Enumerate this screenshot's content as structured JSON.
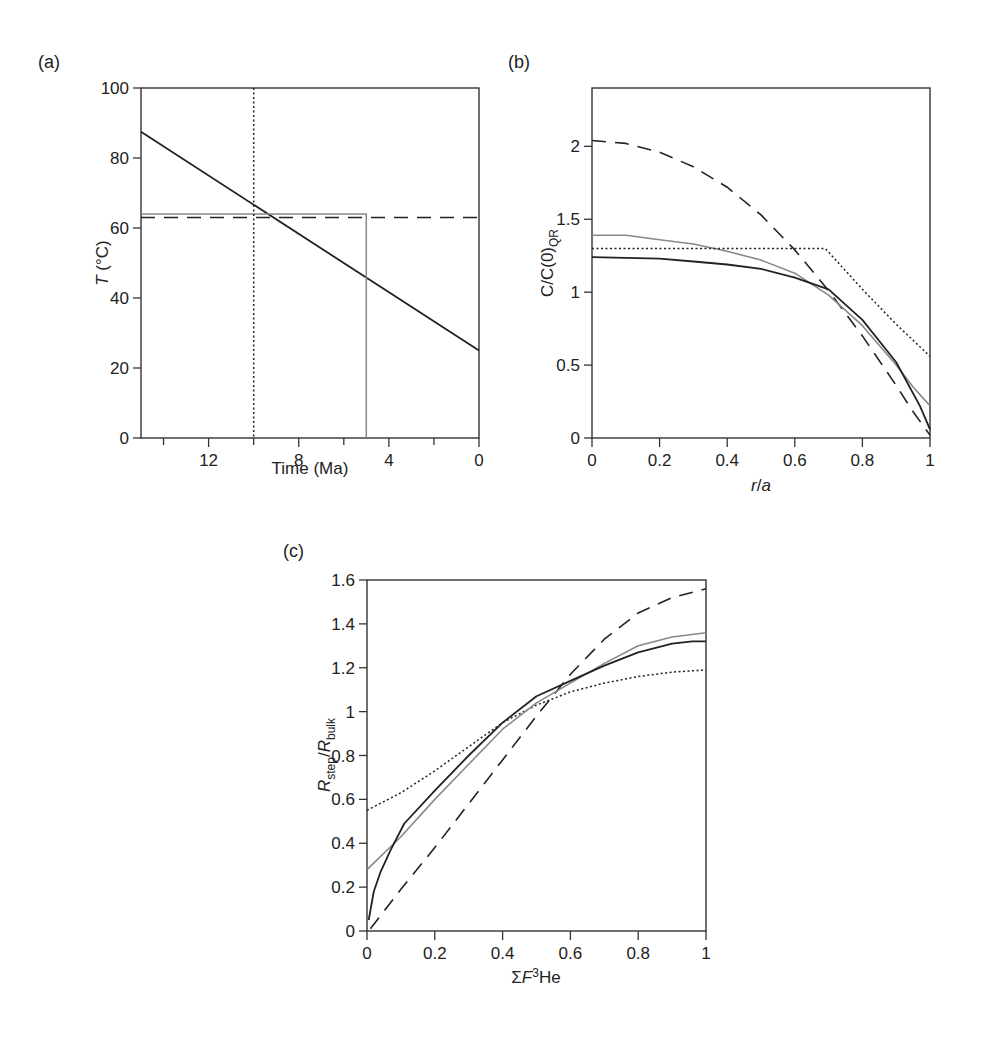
{
  "figure": {
    "panels": [
      "(a)",
      "(b)",
      "(c)"
    ]
  },
  "chart_data": [
    {
      "id": "a",
      "panel_label": "(a)",
      "type": "line",
      "title": "",
      "xlabel": "Time (Ma)",
      "ylabel": "T (°C)",
      "xlim": [
        15,
        0
      ],
      "ylim": [
        0,
        100
      ],
      "x_inverted": true,
      "xticks": [
        12,
        8,
        4,
        0
      ],
      "xminor_ticks": [
        14,
        10,
        6,
        2
      ],
      "yticks": [
        0,
        20,
        40,
        60,
        80,
        100
      ],
      "grid": false,
      "series": [
        {
          "name": "linear cooling path",
          "style": "solid",
          "color": "#222222",
          "width": 1.8,
          "x": [
            15,
            0
          ],
          "y": [
            87.5,
            25
          ]
        },
        {
          "name": "isothermal holding (gray)",
          "style": "solid",
          "color": "#888888",
          "width": 1.5,
          "x": [
            15,
            5,
            5
          ],
          "y": [
            64,
            64,
            0
          ]
        },
        {
          "name": "constant temperature (dashed)",
          "style": "dashed",
          "color": "#222222",
          "width": 1.5,
          "x": [
            15,
            0
          ],
          "y": [
            63,
            63
          ]
        },
        {
          "name": "instantaneous cooling at 10 Ma (dotted)",
          "style": "dotted",
          "color": "#222222",
          "width": 1.5,
          "x": [
            10,
            10
          ],
          "y": [
            100,
            0
          ]
        }
      ]
    },
    {
      "id": "b",
      "panel_label": "(b)",
      "type": "line",
      "title": "",
      "xlabel": "r/a",
      "ylabel": "C/C(0)QR",
      "xlim": [
        0,
        1.0
      ],
      "ylim": [
        0,
        2.4
      ],
      "xticks": [
        0,
        0.2,
        0.4,
        0.6,
        0.8,
        1.0
      ],
      "yticks": [
        0,
        0.5,
        1.0,
        1.5,
        2.0
      ],
      "grid": false,
      "series": [
        {
          "name": "dashed",
          "style": "dashed",
          "color": "#222222",
          "width": 1.6,
          "x": [
            0,
            0.1,
            0.2,
            0.3,
            0.4,
            0.5,
            0.6,
            0.7,
            0.8,
            0.9,
            0.95,
            1.0
          ],
          "y": [
            2.04,
            2.02,
            1.96,
            1.86,
            1.72,
            1.53,
            1.29,
            1.01,
            0.7,
            0.36,
            0.18,
            0.02
          ]
        },
        {
          "name": "gray",
          "style": "solid",
          "color": "#888888",
          "width": 1.6,
          "x": [
            0,
            0.1,
            0.2,
            0.3,
            0.4,
            0.5,
            0.6,
            0.7,
            0.8,
            0.9,
            0.95,
            1.0
          ],
          "y": [
            1.39,
            1.39,
            1.36,
            1.33,
            1.28,
            1.22,
            1.13,
            0.98,
            0.77,
            0.5,
            0.35,
            0.22
          ]
        },
        {
          "name": "dotted",
          "style": "dotted",
          "color": "#222222",
          "width": 1.5,
          "x": [
            0,
            0.69,
            0.8,
            0.9,
            1.0
          ],
          "y": [
            1.3,
            1.3,
            1.02,
            0.78,
            0.56
          ]
        },
        {
          "name": "solid black",
          "style": "solid",
          "color": "#222222",
          "width": 1.8,
          "x": [
            0,
            0.1,
            0.2,
            0.3,
            0.4,
            0.5,
            0.6,
            0.7,
            0.8,
            0.9,
            0.97,
            1.0
          ],
          "y": [
            1.24,
            1.235,
            1.23,
            1.21,
            1.19,
            1.16,
            1.1,
            1.02,
            0.81,
            0.52,
            0.22,
            0.06
          ]
        }
      ]
    },
    {
      "id": "c",
      "panel_label": "(c)",
      "type": "line",
      "title": "",
      "xlabel": "ΣF3He",
      "ylabel": "Rstep/Rbulk",
      "xlim": [
        0,
        1.0
      ],
      "ylim": [
        0,
        1.6
      ],
      "xticks": [
        0,
        0.2,
        0.4,
        0.6,
        0.8,
        1.0
      ],
      "yticks": [
        0,
        0.2,
        0.4,
        0.6,
        0.8,
        1.0,
        1.2,
        1.4,
        1.6
      ],
      "grid": false,
      "series": [
        {
          "name": "dashed",
          "style": "dashed",
          "color": "#222222",
          "width": 1.6,
          "x": [
            0.01,
            0.1,
            0.2,
            0.3,
            0.4,
            0.5,
            0.6,
            0.7,
            0.8,
            0.9,
            1.0
          ],
          "y": [
            0.01,
            0.19,
            0.38,
            0.58,
            0.78,
            0.98,
            1.17,
            1.33,
            1.45,
            1.52,
            1.56
          ]
        },
        {
          "name": "dotted",
          "style": "dotted",
          "color": "#222222",
          "width": 1.5,
          "x": [
            0,
            0.1,
            0.2,
            0.3,
            0.4,
            0.5,
            0.6,
            0.7,
            0.8,
            0.9,
            1.0
          ],
          "y": [
            0.55,
            0.63,
            0.73,
            0.84,
            0.95,
            1.03,
            1.09,
            1.13,
            1.16,
            1.18,
            1.19
          ]
        },
        {
          "name": "gray",
          "style": "solid",
          "color": "#888888",
          "width": 1.6,
          "x": [
            0,
            0.1,
            0.2,
            0.3,
            0.4,
            0.5,
            0.6,
            0.7,
            0.8,
            0.9,
            1.0
          ],
          "y": [
            0.28,
            0.43,
            0.6,
            0.76,
            0.92,
            1.04,
            1.13,
            1.22,
            1.3,
            1.34,
            1.36
          ]
        },
        {
          "name": "solid black",
          "style": "solid",
          "color": "#222222",
          "width": 1.8,
          "x": [
            0.005,
            0.02,
            0.04,
            0.07,
            0.11,
            0.2,
            0.3,
            0.4,
            0.5,
            0.6,
            0.7,
            0.8,
            0.9,
            0.96,
            1.0
          ],
          "y": [
            0.05,
            0.18,
            0.27,
            0.37,
            0.49,
            0.64,
            0.8,
            0.95,
            1.07,
            1.14,
            1.21,
            1.27,
            1.31,
            1.32,
            1.32
          ]
        }
      ]
    }
  ]
}
